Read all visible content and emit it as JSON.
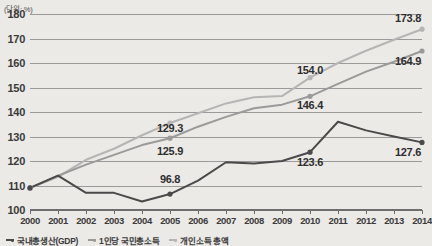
{
  "unit_label": "(단위: %)",
  "legend": [
    {
      "label": "국내총생산(GDP)",
      "color": "#4a4a4a"
    },
    {
      "label": "1인당 국민총소득",
      "color": "#9a9a9a"
    },
    {
      "label": "개인소득 총액",
      "color": "#b5b5b5"
    }
  ],
  "chart_data": {
    "type": "line",
    "title": "",
    "xlabel": "",
    "ylabel": "",
    "unit": "(단위: %)",
    "categories": [
      "2000",
      "2001",
      "2002",
      "2003",
      "2004",
      "2005",
      "2006",
      "2007",
      "2008",
      "2009",
      "2010",
      "2011",
      "2012",
      "2013",
      "2014"
    ],
    "ylim": [
      100,
      180
    ],
    "ytick_labels": [
      "100",
      "110",
      "120",
      "130",
      "140",
      "150",
      "160",
      "170",
      "180"
    ],
    "ytick_values": [
      100,
      110,
      120,
      130,
      140,
      150,
      160,
      170,
      180
    ],
    "grid": true,
    "legend_position": "bottom-left",
    "series": [
      {
        "name": "개인소득 총액",
        "color": "#b5b5b5",
        "values": [
          109.0,
          113.5,
          120.5,
          125.0,
          130.5,
          135.5,
          139.5,
          143.5,
          146.0,
          146.5,
          154.0,
          160.0,
          165.0,
          169.5,
          173.8
        ],
        "labels": [
          {
            "category": "2005",
            "value": 129.3,
            "text": "129.3"
          },
          {
            "category": "2010",
            "value": 154.0,
            "text": "154.0"
          },
          {
            "category": "2014",
            "value": 173.8,
            "text": "173.8"
          }
        ]
      },
      {
        "name": "1인당 국민총소득",
        "color": "#9a9a9a",
        "values": [
          109.0,
          114.0,
          118.5,
          122.5,
          126.5,
          129.3,
          134.0,
          138.0,
          141.5,
          143.0,
          146.4,
          151.5,
          156.5,
          160.5,
          164.9
        ],
        "labels": [
          {
            "category": "2005",
            "value": 125.9,
            "text": "125.9"
          },
          {
            "category": "2010",
            "value": 146.4,
            "text": "146.4"
          },
          {
            "category": "2014",
            "value": 164.9,
            "text": "164.9"
          }
        ]
      },
      {
        "name": "국내총생산(GDP)",
        "color": "#4a4a4a",
        "values": [
          109.0,
          114.0,
          107.0,
          107.0,
          103.5,
          106.5,
          112.0,
          119.5,
          119.0,
          120.0,
          123.6,
          136.0,
          132.5,
          130.0,
          127.6
        ],
        "labels": [
          {
            "category": "2005",
            "value": 96.8,
            "text": "96.8"
          },
          {
            "category": "2010",
            "value": 123.6,
            "text": "123.6"
          },
          {
            "category": "2014",
            "value": 127.6,
            "text": "127.6"
          }
        ]
      }
    ],
    "data_labels": [
      {
        "text": "129.3",
        "category": "2005",
        "y_anchor": 133.5
      },
      {
        "text": "125.9",
        "category": "2005",
        "y_anchor": 124.0
      },
      {
        "text": "96.8",
        "category": "2005",
        "y_anchor": 112.5
      },
      {
        "text": "154.0",
        "category": "2010",
        "y_anchor": 157.0
      },
      {
        "text": "146.4",
        "category": "2010",
        "y_anchor": 143.0
      },
      {
        "text": "123.6",
        "category": "2010",
        "y_anchor": 119.5
      },
      {
        "text": "173.8",
        "category": "2014",
        "y_anchor": 178.5
      },
      {
        "text": "164.9",
        "category": "2014",
        "y_anchor": 161.0
      },
      {
        "text": "127.6",
        "category": "2014",
        "y_anchor": 123.5
      }
    ]
  }
}
